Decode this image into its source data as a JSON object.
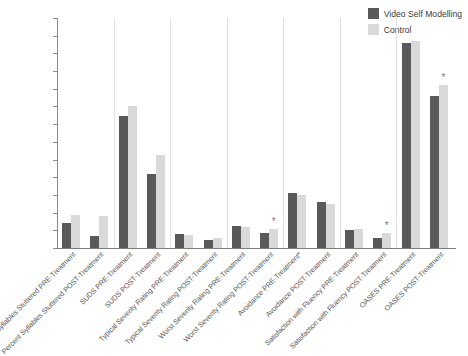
{
  "chart_data": {
    "type": "bar",
    "title": "",
    "xlabel": "",
    "ylabel": "",
    "ylim": [
      0,
      65
    ],
    "ytick_step": 5,
    "yticks": [
      0,
      5,
      10,
      15,
      20,
      25,
      30,
      35,
      40,
      45,
      50,
      55,
      60,
      65
    ],
    "grid": false,
    "legend_position": "top-right",
    "categories": [
      "Percent Syllables Stuttered PRE-Treatment",
      "Percent Syllables Stuttered POST-Treatment",
      "SUDS PRE-Treatment",
      "SUDS POST-Treatment",
      "Typical Severity Rating PRE-Treatment",
      "Typical Severity Rating POST-Treatment",
      "Worst Severity Rating PRE-Treatment",
      "Worst Severity Rating POST-Treatment",
      "Avoidance PRE-Treatment*",
      "Avoidance POST-Treatment",
      "Satisfaction with Fluency PRE-Treatment",
      "Satisfaction with Fluency POST-Treatment",
      "OASES PRE-Treatment",
      "OASES POST-Treatment"
    ],
    "series": [
      {
        "name": "Video Self Modelling",
        "color": "#595959",
        "values": [
          7.2,
          3.4,
          37.3,
          21.0,
          4.0,
          2.4,
          6.3,
          4.2,
          15.6,
          12.9,
          5.2,
          2.9,
          58.0,
          43.0
        ]
      },
      {
        "name": "Control",
        "color": "#d9d9d9",
        "values": [
          9.2,
          9.1,
          40.0,
          26.3,
          3.8,
          2.7,
          5.8,
          5.3,
          14.9,
          12.3,
          5.5,
          4.2,
          58.5,
          46.0
        ]
      }
    ],
    "annotations": [
      {
        "category_index": 7,
        "series": "Control",
        "marker": "*"
      },
      {
        "category_index": 11,
        "series": "Control",
        "marker": "*"
      },
      {
        "category_index": 13,
        "series": "Control",
        "marker": "*"
      }
    ],
    "group_separators_after": [
      1,
      3,
      5,
      7,
      9,
      11
    ]
  },
  "legend": {
    "items": [
      {
        "label": "Video Self Modelling",
        "color": "#595959"
      },
      {
        "label": "Control",
        "color": "#d9d9d9"
      }
    ]
  },
  "colors": {
    "vsm": "#595959",
    "control": "#d9d9d9",
    "axis": "#8a8a8a",
    "separator": "#e2e2e2",
    "text": "#4d4d4d",
    "background": "#ffffff"
  }
}
